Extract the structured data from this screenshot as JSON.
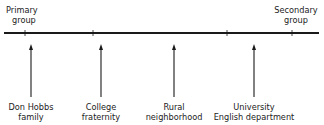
{
  "diagram": {
    "type": "continuum",
    "left_end": {
      "line1": "Primary",
      "line2": "group"
    },
    "right_end": {
      "line1": "Secondary",
      "line2": "group"
    },
    "tick_positions_x": [
      25,
      93,
      227,
      292
    ],
    "items": [
      {
        "line1": "Don Hobbs",
        "line2": "family",
        "x": 31
      },
      {
        "line1": "College",
        "line2": "fraternity",
        "x": 101
      },
      {
        "line1": "Rural",
        "line2": "neighborhood",
        "x": 174
      },
      {
        "line1": "University",
        "line2": "English department",
        "x": 254
      }
    ],
    "colors": {
      "line": "#1a1a1a",
      "text": "#222222",
      "background": "#ffffff"
    }
  }
}
